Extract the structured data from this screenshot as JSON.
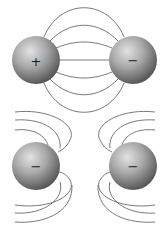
{
  "diagram": {
    "panels": [
      {
        "name": "opposite-charges",
        "charges": [
          {
            "sign": "+",
            "label": "+",
            "cx": 36,
            "cy": 60,
            "r": 24
          },
          {
            "sign": "-",
            "label": "−",
            "cx": 133,
            "cy": 60,
            "r": 24
          }
        ]
      },
      {
        "name": "like-charges",
        "charges": [
          {
            "sign": "-",
            "label": "−",
            "cx": 36,
            "cy": 166,
            "r": 24
          },
          {
            "sign": "-",
            "label": "−",
            "cx": 133,
            "cy": 166,
            "r": 24
          }
        ]
      }
    ],
    "colors": {
      "sphere_light": "#d8d8d8",
      "sphere_mid": "#9a9a9a",
      "sphere_dark": "#4a4a4a",
      "field_line": "#6a6a6a",
      "background": "#ffffff"
    }
  }
}
